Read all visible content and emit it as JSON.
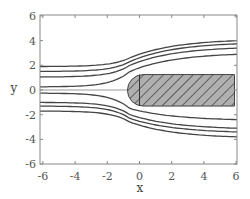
{
  "chart_data": {
    "type": "line",
    "title": "",
    "xlabel": "x",
    "ylabel": "y",
    "xlim": [
      -6.2,
      6.2
    ],
    "ylim": [
      -6.1,
      6.1
    ],
    "xticks": [
      -6,
      -4,
      -2,
      0,
      2,
      4,
      6
    ],
    "yticks": [
      -6,
      -4,
      -2,
      0,
      2,
      4,
      6
    ],
    "xtick_labels": [
      "-6",
      "-4",
      "-2",
      "0",
      "2",
      "4",
      "6"
    ],
    "ytick_labels": [
      "-6",
      "-4",
      "-2",
      "0",
      "2",
      "4",
      "6"
    ],
    "grid": false,
    "legend": null,
    "streamlines": [
      {
        "name": "upper-1",
        "y_left": 1.9,
        "y_at_0": 2.6,
        "y_right": 4.0
      },
      {
        "name": "upper-2",
        "y_left": 1.5,
        "y_at_0": 2.3,
        "y_right": 3.75
      },
      {
        "name": "upper-3",
        "y_left": 1.05,
        "y_at_0": 2.0,
        "y_right": 3.4
      },
      {
        "name": "upper-4",
        "y_left": 0.25,
        "y_at_0": 1.5,
        "y_right": 2.9
      },
      {
        "name": "center",
        "y_left": 0.0,
        "y_at_0": 0.0,
        "y_right": 0.0,
        "ends_at_x": -0.75
      },
      {
        "name": "lower-1",
        "y_left": -0.25,
        "y_at_0": -1.5,
        "y_right": -2.4
      },
      {
        "name": "lower-2",
        "y_left": -1.0,
        "y_at_0": -2.0,
        "y_right": -3.1
      },
      {
        "name": "lower-3",
        "y_left": -1.3,
        "y_at_0": -2.3,
        "y_right": -3.4
      },
      {
        "name": "lower-4",
        "y_left": -1.7,
        "y_at_0": -2.6,
        "y_right": -3.8
      }
    ],
    "obstacle": {
      "shape": "rounded-left rectangle (hatched)",
      "x_range": [
        -0.75,
        5.9
      ],
      "y_range": [
        -1.3,
        1.25
      ],
      "inner_line_x": 0,
      "fill": "#b0b0b0",
      "hatch_color": "#333333"
    }
  },
  "colors": {
    "axis": "#888888",
    "streamline": "#444444",
    "center_line": "#999999"
  }
}
